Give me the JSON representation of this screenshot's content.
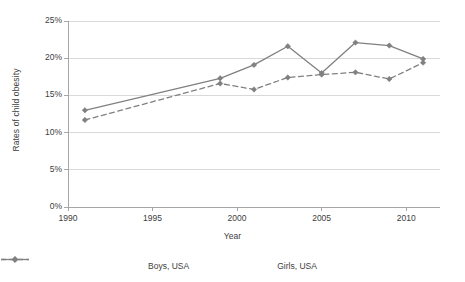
{
  "chart_data": {
    "type": "line",
    "title": "",
    "xlabel": "Year",
    "ylabel": "Rates of child obesity",
    "xlim": [
      1990,
      2012
    ],
    "ylim": [
      0,
      25
    ],
    "x_ticks": [
      "1990",
      "1995",
      "2000",
      "2005",
      "2010"
    ],
    "x_tick_values": [
      1990,
      1995,
      2000,
      2005,
      2010
    ],
    "y_ticks": [
      "0%",
      "5%",
      "10%",
      "15%",
      "20%",
      "25%"
    ],
    "y_tick_values": [
      0,
      5,
      10,
      15,
      20,
      25
    ],
    "grid": "horizontal",
    "legend_position": "bottom",
    "x": [
      1991,
      1999,
      2001,
      2003,
      2005,
      2007,
      2009,
      2011
    ],
    "series": [
      {
        "name": "Boys, USA",
        "style": "solid",
        "marker": "diamond",
        "color": "#808080",
        "values": [
          13.0,
          17.3,
          19.1,
          21.6,
          18.0,
          22.1,
          21.7,
          19.9
        ]
      },
      {
        "name": "Girls, USA",
        "style": "dashed",
        "marker": "diamond",
        "color": "#808080",
        "values": [
          11.7,
          16.6,
          15.8,
          17.4,
          17.8,
          18.1,
          17.2,
          19.4
        ]
      }
    ]
  },
  "colors": {
    "axis": "#a6a6a6",
    "grid": "#d9d9d9",
    "line": "#808080",
    "text": "#404040",
    "background": "#ffffff"
  }
}
